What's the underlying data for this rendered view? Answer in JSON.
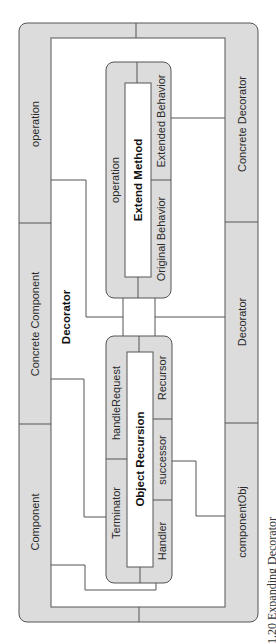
{
  "diagram": {
    "title": "Decorator",
    "outer_frame": {
      "left_column": [
        "operation",
        "Concrete Component",
        "Component"
      ],
      "right_column": [
        "Concrete Decorator",
        "Decorator",
        "componentObj"
      ]
    },
    "extend_method": {
      "title": "Extend Method",
      "left_label": "operation",
      "right_top": "Extended Behavior",
      "right_bottom": "Original Behavior"
    },
    "object_recursion": {
      "title": "Object Recursion",
      "left_top": "handleRequest",
      "left_bottom": "Terminator",
      "right_top": "Recursor",
      "right_middle": "successor",
      "right_bottom": "Handler"
    },
    "caption": "1.20 Expanding Decorator"
  },
  "colors": {
    "fill": "#dcdcdc",
    "stroke": "#555555",
    "background": "#ffffff"
  }
}
